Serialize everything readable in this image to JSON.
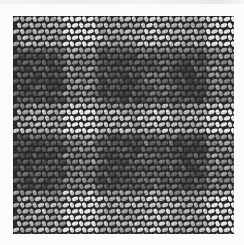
{
  "image": {
    "subject": "woven fabric texture, close-up, grayscale",
    "pattern": "gingham-like check with alternating light and dark bands",
    "bands": {
      "horizontal": [
        {
          "tone": "light"
        },
        {
          "tone": "dark"
        },
        {
          "tone": "light"
        },
        {
          "tone": "dark"
        },
        {
          "tone": "light"
        }
      ],
      "vertical": [
        {
          "tone": "dark"
        },
        {
          "tone": "light"
        },
        {
          "tone": "dark"
        },
        {
          "tone": "mid"
        },
        {
          "tone": "dark"
        },
        {
          "tone": "light"
        }
      ]
    },
    "colors": {
      "background": "#fbfbfb",
      "thread_light": "#e6e6e6",
      "thread_mid": "#9a9a9a",
      "thread_dark": "#3a3a3a",
      "gap": "#2a2a2a"
    }
  }
}
